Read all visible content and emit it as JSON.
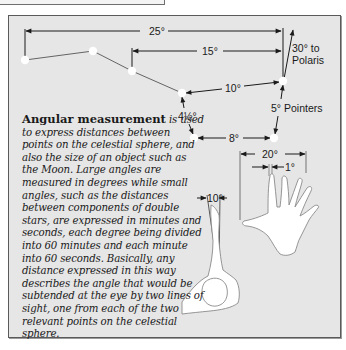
{
  "figure": {
    "title": "Angular measurement",
    "caption_lead": "Angular measurement",
    "caption_body": " is used to express distances between points on the celestial sphere, and also the size of an object such as the Moon. Large angles are measured in degrees while small angles, such as the distances between components of double stars, are expressed in minutes and seconds, each degree being divided into 60 minutes and each minute into 60 seconds. Basically, any distance expressed in this way describes the angle that would be subtended at the eye by two lines of sight, one from each of the two relevant points on the celestial sphere."
  },
  "constellation": {
    "name": "Plough / Big Dipper",
    "stars": [
      {
        "x": 25,
        "y": 60
      },
      {
        "x": 93,
        "y": 51
      },
      {
        "x": 132,
        "y": 71
      },
      {
        "x": 182,
        "y": 93
      },
      {
        "x": 283,
        "y": 81
      },
      {
        "x": 274,
        "y": 138
      },
      {
        "x": 194,
        "y": 138
      }
    ]
  },
  "labels": {
    "span_25": "25°",
    "span_15": "15°",
    "polaris_line1": "30° to",
    "polaris_line2": "Polaris",
    "span_10": "10°",
    "pointers": "5° Pointers",
    "span_4half": "4½°",
    "span_8": "8°",
    "hand_span": "20°",
    "finger_width": "1°",
    "fist_width": "10°"
  },
  "colors": {
    "panel_bg": "#e6e6e6",
    "border": "#5a5a5a",
    "ink": "#1a1a1a",
    "star": "#ffffff"
  }
}
